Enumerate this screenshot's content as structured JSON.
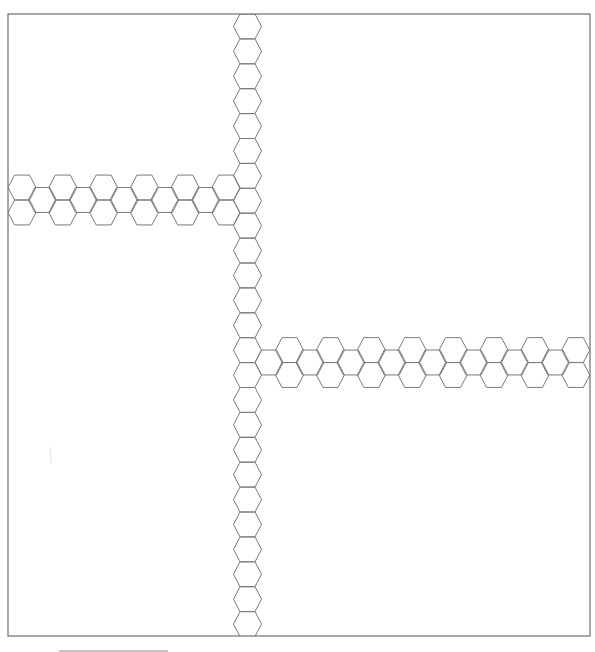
{
  "canvas": {
    "width": 595,
    "height": 652,
    "background": "#ffffff"
  },
  "colors": {
    "line": "#7a7a7a",
    "frame": "#6e6e6e",
    "scalebar": "#8a8a8a"
  },
  "frame": {
    "x": 8,
    "y": 14,
    "width": 582,
    "height": 622
  },
  "hexagon": {
    "orientation": "flat-top",
    "half_width": 14,
    "half_flat": 7.5,
    "half_height": 12.45
  },
  "strips": [
    {
      "name": "vertical-strip",
      "direction": "vertical",
      "center_x": 247.5,
      "first_center_y": 26.45,
      "step_y": 24.9,
      "count": 25
    },
    {
      "name": "left-horizontal-strip",
      "direction": "horizontal",
      "first_full_col_x": 22,
      "col_step": 40.8,
      "full_cols": 6,
      "row_centers_y": [
        187.5,
        212.5
      ],
      "mid_center_y": 200
    },
    {
      "name": "right-horizontal-strip",
      "direction": "horizontal",
      "first_full_col_x": 289.5,
      "col_step": 40.9,
      "full_cols": 8,
      "row_centers_y": [
        350.1,
        375
      ],
      "mid_center_y": 362.5,
      "leading_mid_col": true
    }
  ],
  "scale_bar": {
    "x1": 59,
    "x2": 168,
    "y": 651
  },
  "artifact_mark": {
    "x": 50,
    "y1": 447,
    "y2": 463
  }
}
